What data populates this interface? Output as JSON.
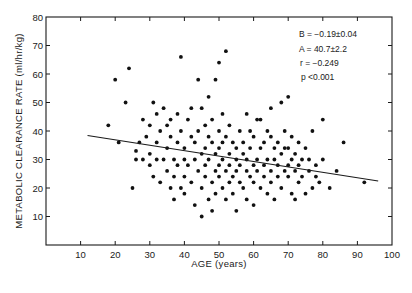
{
  "chart_data": {
    "type": "scatter",
    "title": "",
    "xlabel": "AGE (years)",
    "ylabel": "METABOLIC CLEARANCE RATE (ml/hr/kg)",
    "xlim": [
      0,
      100
    ],
    "ylim": [
      0,
      80
    ],
    "xticks": [
      10,
      20,
      30,
      40,
      50,
      60,
      70,
      80,
      90,
      100
    ],
    "yticks": [
      10,
      20,
      30,
      40,
      50,
      60,
      70,
      80
    ],
    "grid": false,
    "legend": null,
    "annotations": [
      "B = −0.19±0.04",
      "A = 40.7±2.2",
      "r = −0.249",
      "p  <0.001"
    ],
    "regression_line": {
      "slope": -0.19,
      "intercept": 40.7,
      "x_start": 12,
      "x_end": 96
    },
    "points": [
      [
        18,
        42
      ],
      [
        20,
        58
      ],
      [
        21,
        36
      ],
      [
        23,
        50
      ],
      [
        24,
        62
      ],
      [
        25,
        20
      ],
      [
        26,
        30
      ],
      [
        26,
        33
      ],
      [
        27,
        36
      ],
      [
        28,
        44
      ],
      [
        28,
        30
      ],
      [
        29,
        38
      ],
      [
        30,
        28
      ],
      [
        30,
        32
      ],
      [
        30,
        42
      ],
      [
        31,
        50
      ],
      [
        31,
        24
      ],
      [
        32,
        30
      ],
      [
        32,
        36
      ],
      [
        32,
        46
      ],
      [
        33,
        22
      ],
      [
        33,
        40
      ],
      [
        34,
        30
      ],
      [
        34,
        48
      ],
      [
        35,
        26
      ],
      [
        35,
        34
      ],
      [
        35,
        42
      ],
      [
        36,
        20
      ],
      [
        36,
        38
      ],
      [
        36,
        44
      ],
      [
        37,
        24
      ],
      [
        37,
        30
      ],
      [
        37,
        16
      ],
      [
        38,
        28
      ],
      [
        38,
        46
      ],
      [
        38,
        36
      ],
      [
        39,
        20
      ],
      [
        39,
        40
      ],
      [
        39,
        66
      ],
      [
        40,
        34
      ],
      [
        40,
        24
      ],
      [
        40,
        30
      ],
      [
        40,
        18
      ],
      [
        41,
        44
      ],
      [
        41,
        28
      ],
      [
        42,
        38
      ],
      [
        42,
        22
      ],
      [
        42,
        48
      ],
      [
        43,
        30
      ],
      [
        43,
        14
      ],
      [
        43,
        36
      ],
      [
        44,
        26
      ],
      [
        44,
        40
      ],
      [
        44,
        58
      ],
      [
        45,
        20
      ],
      [
        45,
        32
      ],
      [
        45,
        10
      ],
      [
        45,
        48
      ],
      [
        46,
        34
      ],
      [
        46,
        24
      ],
      [
        46,
        28
      ],
      [
        46,
        42
      ],
      [
        47,
        38
      ],
      [
        47,
        16
      ],
      [
        47,
        52
      ],
      [
        47,
        30
      ],
      [
        48,
        22
      ],
      [
        48,
        44
      ],
      [
        48,
        36
      ],
      [
        48,
        12
      ],
      [
        49,
        26
      ],
      [
        49,
        58
      ],
      [
        49,
        32
      ],
      [
        49,
        18
      ],
      [
        50,
        40
      ],
      [
        50,
        28
      ],
      [
        50,
        24
      ],
      [
        50,
        34
      ],
      [
        50,
        64
      ],
      [
        51,
        20
      ],
      [
        51,
        36
      ],
      [
        51,
        46
      ],
      [
        51,
        30
      ],
      [
        52,
        26
      ],
      [
        52,
        16
      ],
      [
        52,
        38
      ],
      [
        52,
        68
      ],
      [
        53,
        32
      ],
      [
        53,
        22
      ],
      [
        53,
        28
      ],
      [
        53,
        42
      ],
      [
        54,
        24
      ],
      [
        54,
        36
      ],
      [
        54,
        18
      ],
      [
        55,
        34
      ],
      [
        55,
        26
      ],
      [
        55,
        30
      ],
      [
        55,
        12
      ],
      [
        56,
        40
      ],
      [
        56,
        22
      ],
      [
        56,
        28
      ],
      [
        57,
        32
      ],
      [
        57,
        20
      ],
      [
        57,
        36
      ],
      [
        58,
        26
      ],
      [
        58,
        46
      ],
      [
        58,
        30
      ],
      [
        58,
        16
      ],
      [
        59,
        24
      ],
      [
        59,
        34
      ],
      [
        59,
        40
      ],
      [
        60,
        28
      ],
      [
        60,
        22
      ],
      [
        60,
        38
      ],
      [
        60,
        14
      ],
      [
        61,
        44
      ],
      [
        61,
        30
      ],
      [
        61,
        26
      ],
      [
        62,
        20
      ],
      [
        62,
        34
      ],
      [
        62,
        44
      ],
      [
        63,
        36
      ],
      [
        63,
        24
      ],
      [
        63,
        28
      ],
      [
        64,
        30
      ],
      [
        64,
        18
      ],
      [
        64,
        40
      ],
      [
        65,
        26
      ],
      [
        65,
        38
      ],
      [
        65,
        22
      ],
      [
        65,
        48
      ],
      [
        66,
        34
      ],
      [
        66,
        30
      ],
      [
        66,
        16
      ],
      [
        67,
        24
      ],
      [
        67,
        36
      ],
      [
        67,
        28
      ],
      [
        68,
        32
      ],
      [
        68,
        50
      ],
      [
        68,
        20
      ],
      [
        69,
        26
      ],
      [
        69,
        40
      ],
      [
        69,
        34
      ],
      [
        70,
        28
      ],
      [
        70,
        24
      ],
      [
        70,
        52
      ],
      [
        70,
        34
      ],
      [
        71,
        18
      ],
      [
        71,
        30
      ],
      [
        71,
        38
      ],
      [
        72,
        26
      ],
      [
        72,
        32
      ],
      [
        72,
        16
      ],
      [
        73,
        36
      ],
      [
        73,
        22
      ],
      [
        73,
        28
      ],
      [
        74,
        30
      ],
      [
        74,
        24
      ],
      [
        75,
        34
      ],
      [
        75,
        18
      ],
      [
        76,
        26
      ],
      [
        76,
        30
      ],
      [
        77,
        20
      ],
      [
        77,
        40
      ],
      [
        78,
        28
      ],
      [
        78,
        24
      ],
      [
        79,
        22
      ],
      [
        80,
        44
      ],
      [
        80,
        30
      ],
      [
        82,
        20
      ],
      [
        84,
        26
      ],
      [
        86,
        36
      ],
      [
        92,
        22
      ]
    ]
  },
  "annotations_panel": {
    "line1": "B = −0.19±0.04",
    "line2": "A = 40.7±2.2",
    "line3": "r = −0.249",
    "line4": "p  <0.001"
  },
  "axes": {
    "xlabel": "AGE (years)",
    "ylabel": "METABOLIC CLEARANCE RATE (ml/hr/kg)"
  }
}
